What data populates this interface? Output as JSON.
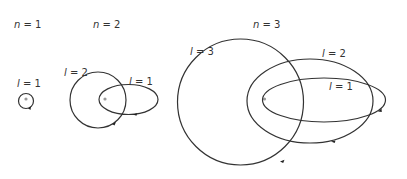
{
  "diagram": {
    "groups": [
      {
        "label": "n = 1",
        "orbits": [
          {
            "label": "l = 1",
            "shape": "circle"
          }
        ]
      },
      {
        "label": "n = 2",
        "orbits": [
          {
            "label": "l = 2",
            "shape": "circle"
          },
          {
            "label": "l = 1",
            "shape": "ellipse"
          }
        ]
      },
      {
        "label": "n = 3",
        "orbits": [
          {
            "label": "l = 3",
            "shape": "circle"
          },
          {
            "label": "l = 2",
            "shape": "ellipse"
          },
          {
            "label": "l = 1",
            "shape": "ellipse"
          }
        ]
      }
    ],
    "colors": {
      "line": "#333333",
      "nucleus": "#999999",
      "background": "#ffffff"
    }
  }
}
